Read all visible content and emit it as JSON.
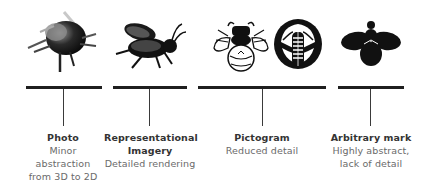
{
  "stages": [
    {
      "title": "Photo",
      "desc": [
        "Minor",
        "abstraction",
        "from 3D to 2D"
      ],
      "icon": "bee-photo-icon"
    },
    {
      "title": "Representational",
      "title2": "Imagery",
      "desc": [
        "Detailed rendering"
      ],
      "icon": "bee-illustration-icon"
    },
    {
      "title": "Pictogram",
      "desc": [
        "Reduced detail"
      ],
      "icons": [
        "bee-outline-icon",
        "bee-circle-emblem-icon"
      ]
    },
    {
      "title": "Arbitrary mark",
      "desc": [
        "Highly abstract,",
        "lack of detail"
      ],
      "icon": "bee-silhouette-icon"
    }
  ],
  "colors": {
    "bar": "#1f1f1f",
    "title": "#333333",
    "desc": "#6a6a6a"
  }
}
